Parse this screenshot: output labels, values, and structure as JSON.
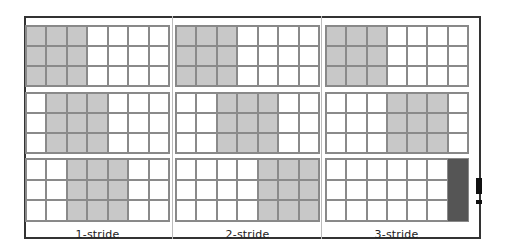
{
  "grid": {
    "rows": 3,
    "cols": 7
  },
  "colors": {
    "window": "#c8c8c8",
    "partial_window": "#555555",
    "line": "#8a8a8a",
    "frame": "#333333"
  },
  "columns": [
    {
      "label": "1-stride",
      "stride": 1,
      "window_starts": [
        0,
        1,
        2
      ]
    },
    {
      "label": "2-stride",
      "stride": 2,
      "window_starts": [
        0,
        2,
        4
      ]
    },
    {
      "label": "3-stride",
      "stride": 3,
      "window_starts": [
        0,
        3,
        6
      ],
      "last_partial": true
    }
  ],
  "window_size": 3
}
